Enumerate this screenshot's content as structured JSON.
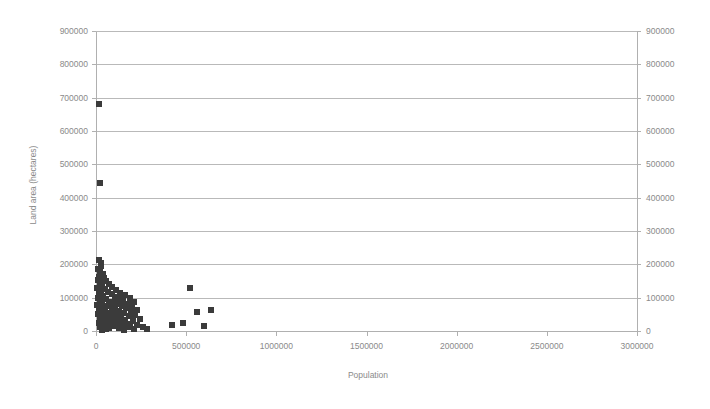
{
  "chart_data": {
    "type": "scatter",
    "title": "",
    "xlabel": "Population",
    "ylabel": "Land area (hectares)",
    "xlim": [
      0,
      3000000
    ],
    "ylim": [
      0,
      900000
    ],
    "grid": true,
    "grid_axis": "y",
    "legend": "none",
    "marker": {
      "shape": "square",
      "color": "#3b3b3b",
      "size_px": 6
    },
    "xticks": [
      0,
      500000,
      1000000,
      1500000,
      2000000,
      2500000,
      3000000
    ],
    "xtick_labels": [
      "0",
      "500000",
      "1000000",
      "1500000",
      "2000000",
      "2500000",
      "3000000"
    ],
    "yticks": [
      0,
      100000,
      200000,
      300000,
      400000,
      500000,
      600000,
      700000,
      800000,
      900000
    ],
    "ytick_labels": [
      "0",
      "100000",
      "200000",
      "300000",
      "400000",
      "500000",
      "600000",
      "700000",
      "800000",
      "900000"
    ],
    "right_axis_ticks": [
      0,
      100000,
      200000,
      300000,
      400000,
      500000,
      600000,
      700000,
      800000,
      900000
    ],
    "right_axis_tick_labels": [
      "0",
      "100000",
      "200000",
      "300000",
      "400000",
      "500000",
      "600000",
      "700000",
      "800000",
      "900000"
    ],
    "points": [
      [
        18000,
        680000
      ],
      [
        22000,
        445000
      ],
      [
        14000,
        212000
      ],
      [
        26000,
        205000
      ],
      [
        30000,
        196000
      ],
      [
        12000,
        186000
      ],
      [
        20000,
        176000
      ],
      [
        38000,
        170000
      ],
      [
        16000,
        163000
      ],
      [
        44000,
        158000
      ],
      [
        10000,
        152000
      ],
      [
        58000,
        150000
      ],
      [
        24000,
        145000
      ],
      [
        70000,
        141000
      ],
      [
        34000,
        137000
      ],
      [
        90000,
        133000
      ],
      [
        8000,
        130000
      ],
      [
        48000,
        126000
      ],
      [
        112000,
        124000
      ],
      [
        28000,
        120000
      ],
      [
        66000,
        117000
      ],
      [
        135000,
        115000
      ],
      [
        18000,
        112000
      ],
      [
        86000,
        110000
      ],
      [
        160000,
        108000
      ],
      [
        40000,
        105000
      ],
      [
        104000,
        103000
      ],
      [
        186000,
        100000
      ],
      [
        12000,
        99000
      ],
      [
        54000,
        96000
      ],
      [
        126000,
        95000
      ],
      [
        152000,
        92000
      ],
      [
        22000,
        90000
      ],
      [
        74000,
        88000
      ],
      [
        210000,
        87000
      ],
      [
        96000,
        85000
      ],
      [
        32000,
        83000
      ],
      [
        178000,
        82000
      ],
      [
        118000,
        80000
      ],
      [
        6000,
        78000
      ],
      [
        62000,
        76000
      ],
      [
        144000,
        75000
      ],
      [
        200000,
        73000
      ],
      [
        44000,
        71000
      ],
      [
        86000,
        70000
      ],
      [
        166000,
        68000
      ],
      [
        16000,
        66000
      ],
      [
        108000,
        65000
      ],
      [
        230000,
        63000
      ],
      [
        52000,
        61000
      ],
      [
        130000,
        60000
      ],
      [
        194000,
        58000
      ],
      [
        26000,
        57000
      ],
      [
        78000,
        55000
      ],
      [
        156000,
        54000
      ],
      [
        10000,
        52000
      ],
      [
        100000,
        50000
      ],
      [
        218000,
        49000
      ],
      [
        36000,
        47000
      ],
      [
        140000,
        46000
      ],
      [
        182000,
        44000
      ],
      [
        68000,
        42000
      ],
      [
        120000,
        41000
      ],
      [
        20000,
        39000
      ],
      [
        94000,
        37000
      ],
      [
        246000,
        36000
      ],
      [
        48000,
        34000
      ],
      [
        162000,
        33000
      ],
      [
        204000,
        31000
      ],
      [
        30000,
        29000
      ],
      [
        82000,
        28000
      ],
      [
        134000,
        27000
      ],
      [
        14000,
        25000
      ],
      [
        110000,
        23000
      ],
      [
        172000,
        22000
      ],
      [
        60000,
        21000
      ],
      [
        226000,
        19000
      ],
      [
        40000,
        17000
      ],
      [
        148000,
        16000
      ],
      [
        96000,
        14000
      ],
      [
        262000,
        13000
      ],
      [
        24000,
        12000
      ],
      [
        190000,
        11000
      ],
      [
        126000,
        9000
      ],
      [
        70000,
        8000
      ],
      [
        284000,
        7000
      ],
      [
        54000,
        6000
      ],
      [
        212000,
        5000
      ],
      [
        158000,
        4000
      ],
      [
        36000,
        3000
      ],
      [
        520000,
        128000
      ],
      [
        640000,
        62000
      ],
      [
        560000,
        56000
      ],
      [
        480000,
        24000
      ],
      [
        600000,
        16000
      ],
      [
        420000,
        18000
      ]
    ]
  }
}
